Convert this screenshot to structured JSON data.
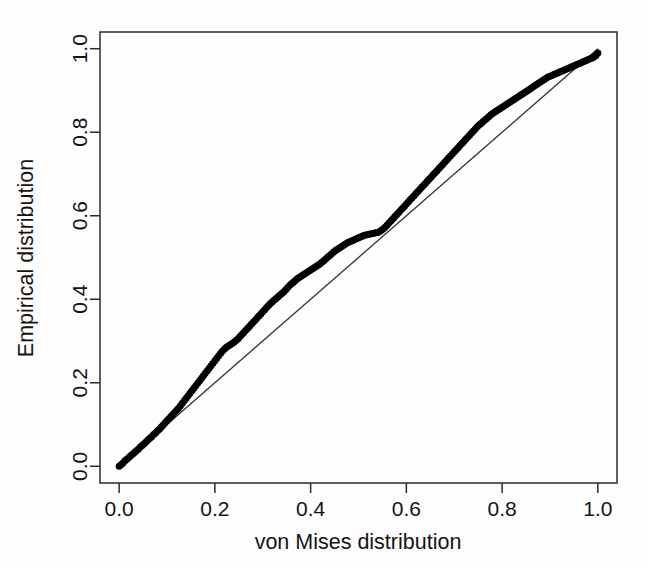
{
  "chart_data": {
    "type": "scatter",
    "title": "",
    "subtitle": "",
    "xlabel": "von Mises distribution",
    "ylabel": "Empirical distribution",
    "xlim": [
      -0.04,
      1.04
    ],
    "ylim": [
      -0.04,
      1.04
    ],
    "xticks": [
      "0.0",
      "0.2",
      "0.4",
      "0.6",
      "0.8",
      "1.0"
    ],
    "xtick_values": [
      0.0,
      0.2,
      0.4,
      0.6,
      0.8,
      1.0
    ],
    "yticks": [
      "0.0",
      "0.2",
      "0.4",
      "0.6",
      "0.8",
      "1.0"
    ],
    "ytick_values": [
      0.0,
      0.2,
      0.4,
      0.6,
      0.8,
      1.0
    ],
    "grid": false,
    "legend": null,
    "legend_position": "none",
    "marker": "filled-circle",
    "marker_color": "#000000",
    "marker_size": 7,
    "reference_line": {
      "name": "identity-line",
      "type": "line",
      "from": [
        0.0,
        0.0
      ],
      "to": [
        1.0,
        1.0
      ],
      "color": "#333333",
      "width": 1.3
    },
    "series": [
      {
        "name": "P-P points",
        "color": "#000000",
        "x": [
          0.0,
          0.004,
          0.008,
          0.012,
          0.016,
          0.02,
          0.024,
          0.028,
          0.032,
          0.036,
          0.04,
          0.044,
          0.048,
          0.052,
          0.056,
          0.06,
          0.064,
          0.068,
          0.072,
          0.076,
          0.08,
          0.084,
          0.088,
          0.092,
          0.096,
          0.1,
          0.104,
          0.108,
          0.112,
          0.116,
          0.12,
          0.124,
          0.128,
          0.132,
          0.136,
          0.14,
          0.144,
          0.148,
          0.152,
          0.156,
          0.16,
          0.164,
          0.168,
          0.172,
          0.176,
          0.18,
          0.184,
          0.188,
          0.192,
          0.196,
          0.2,
          0.204,
          0.208,
          0.212,
          0.216,
          0.22,
          0.224,
          0.228,
          0.232,
          0.236,
          0.24,
          0.244,
          0.248,
          0.252,
          0.256,
          0.26,
          0.264,
          0.268,
          0.272,
          0.276,
          0.28,
          0.284,
          0.288,
          0.292,
          0.296,
          0.3,
          0.304,
          0.308,
          0.312,
          0.316,
          0.32,
          0.324,
          0.328,
          0.332,
          0.336,
          0.34,
          0.344,
          0.348,
          0.352,
          0.356,
          0.36,
          0.364,
          0.368,
          0.372,
          0.376,
          0.38,
          0.384,
          0.388,
          0.392,
          0.396,
          0.4,
          0.404,
          0.408,
          0.412,
          0.416,
          0.42,
          0.424,
          0.428,
          0.432,
          0.436,
          0.44,
          0.444,
          0.448,
          0.452,
          0.456,
          0.46,
          0.464,
          0.468,
          0.472,
          0.476,
          0.48,
          0.484,
          0.488,
          0.492,
          0.496,
          0.5,
          0.504,
          0.508,
          0.512,
          0.516,
          0.52,
          0.524,
          0.528,
          0.532,
          0.536,
          0.54,
          0.544,
          0.548,
          0.552,
          0.556,
          0.56,
          0.564,
          0.568,
          0.572,
          0.576,
          0.58,
          0.584,
          0.588,
          0.592,
          0.596,
          0.6,
          0.604,
          0.608,
          0.612,
          0.616,
          0.62,
          0.624,
          0.628,
          0.632,
          0.636,
          0.64,
          0.644,
          0.648,
          0.652,
          0.656,
          0.66,
          0.664,
          0.668,
          0.672,
          0.676,
          0.68,
          0.684,
          0.688,
          0.692,
          0.696,
          0.7,
          0.704,
          0.708,
          0.712,
          0.716,
          0.72,
          0.724,
          0.728,
          0.732,
          0.736,
          0.74,
          0.744,
          0.748,
          0.752,
          0.756,
          0.76,
          0.764,
          0.768,
          0.772,
          0.776,
          0.78,
          0.784,
          0.788,
          0.792,
          0.796,
          0.8,
          0.804,
          0.808,
          0.812,
          0.816,
          0.82,
          0.824,
          0.828,
          0.832,
          0.836,
          0.84,
          0.844,
          0.848,
          0.852,
          0.856,
          0.86,
          0.864,
          0.868,
          0.872,
          0.876,
          0.88,
          0.884,
          0.888,
          0.892,
          0.896,
          0.9,
          0.904,
          0.908,
          0.912,
          0.916,
          0.92,
          0.924,
          0.928,
          0.932,
          0.936,
          0.94,
          0.944,
          0.948,
          0.952,
          0.956,
          0.96,
          0.964,
          0.968,
          0.972,
          0.976,
          0.98,
          0.984,
          0.988,
          0.992,
          0.996,
          1.0
        ],
        "y": [
          0.0,
          0.004,
          0.008,
          0.013,
          0.017,
          0.021,
          0.025,
          0.029,
          0.033,
          0.037,
          0.041,
          0.046,
          0.05,
          0.054,
          0.058,
          0.063,
          0.067,
          0.071,
          0.076,
          0.08,
          0.085,
          0.089,
          0.094,
          0.099,
          0.104,
          0.109,
          0.114,
          0.119,
          0.124,
          0.129,
          0.134,
          0.139,
          0.145,
          0.151,
          0.157,
          0.163,
          0.169,
          0.175,
          0.181,
          0.187,
          0.193,
          0.199,
          0.205,
          0.211,
          0.217,
          0.223,
          0.229,
          0.235,
          0.241,
          0.247,
          0.253,
          0.259,
          0.265,
          0.271,
          0.276,
          0.281,
          0.285,
          0.288,
          0.291,
          0.294,
          0.297,
          0.301,
          0.305,
          0.31,
          0.315,
          0.32,
          0.325,
          0.33,
          0.335,
          0.34,
          0.345,
          0.35,
          0.355,
          0.36,
          0.365,
          0.37,
          0.375,
          0.38,
          0.385,
          0.39,
          0.394,
          0.398,
          0.402,
          0.406,
          0.41,
          0.414,
          0.418,
          0.423,
          0.428,
          0.433,
          0.437,
          0.441,
          0.445,
          0.449,
          0.452,
          0.455,
          0.458,
          0.461,
          0.464,
          0.467,
          0.47,
          0.473,
          0.476,
          0.479,
          0.482,
          0.485,
          0.489,
          0.493,
          0.497,
          0.501,
          0.505,
          0.509,
          0.513,
          0.517,
          0.52,
          0.523,
          0.526,
          0.529,
          0.532,
          0.535,
          0.537,
          0.539,
          0.541,
          0.543,
          0.545,
          0.547,
          0.549,
          0.551,
          0.553,
          0.554,
          0.555,
          0.556,
          0.557,
          0.558,
          0.559,
          0.56,
          0.562,
          0.565,
          0.569,
          0.573,
          0.578,
          0.583,
          0.588,
          0.593,
          0.598,
          0.603,
          0.608,
          0.613,
          0.618,
          0.623,
          0.628,
          0.633,
          0.638,
          0.643,
          0.648,
          0.653,
          0.658,
          0.663,
          0.668,
          0.673,
          0.678,
          0.683,
          0.688,
          0.693,
          0.698,
          0.703,
          0.708,
          0.713,
          0.718,
          0.723,
          0.728,
          0.733,
          0.738,
          0.743,
          0.748,
          0.753,
          0.758,
          0.763,
          0.768,
          0.773,
          0.778,
          0.783,
          0.788,
          0.793,
          0.798,
          0.803,
          0.808,
          0.813,
          0.817,
          0.821,
          0.825,
          0.829,
          0.833,
          0.837,
          0.841,
          0.845,
          0.848,
          0.851,
          0.854,
          0.857,
          0.86,
          0.863,
          0.866,
          0.869,
          0.872,
          0.875,
          0.878,
          0.881,
          0.884,
          0.887,
          0.89,
          0.893,
          0.896,
          0.899,
          0.902,
          0.905,
          0.908,
          0.911,
          0.914,
          0.917,
          0.92,
          0.923,
          0.926,
          0.929,
          0.932,
          0.934,
          0.936,
          0.938,
          0.94,
          0.942,
          0.944,
          0.946,
          0.948,
          0.95,
          0.952,
          0.954,
          0.956,
          0.958,
          0.96,
          0.962,
          0.964,
          0.966,
          0.968,
          0.97,
          0.972,
          0.974,
          0.976,
          0.978,
          0.98,
          0.984,
          0.99
        ]
      }
    ],
    "annotations": []
  }
}
